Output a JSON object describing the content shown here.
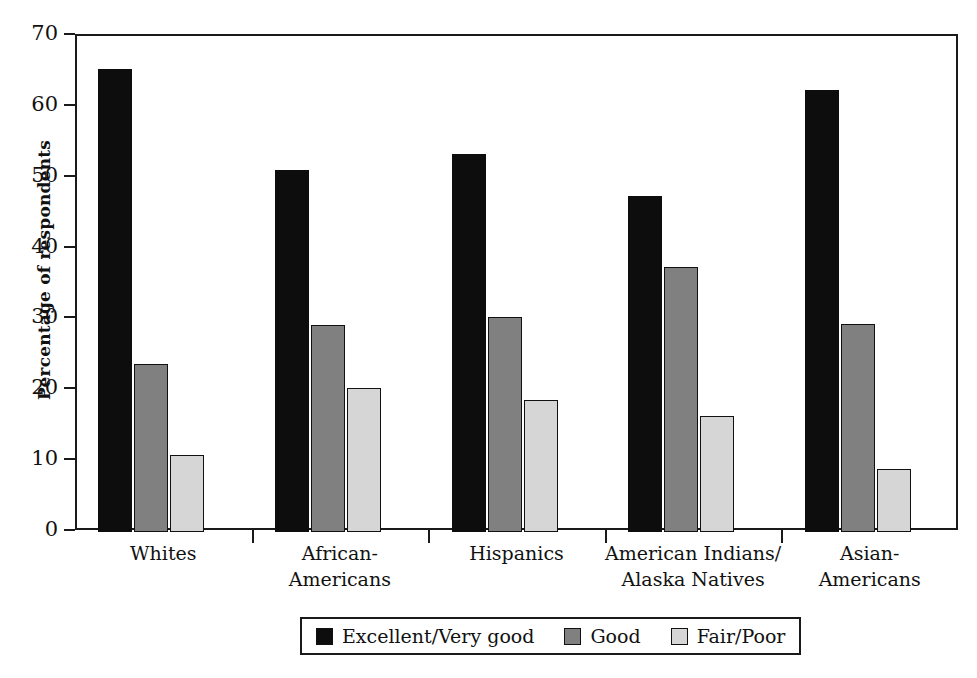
{
  "chart_data": {
    "type": "bar",
    "title": "",
    "subtitle": "",
    "xlabel": "",
    "ylabel": "Percentage of respondents",
    "ylim": [
      0,
      70
    ],
    "yticks": [
      0,
      10,
      20,
      30,
      40,
      50,
      60,
      70
    ],
    "grid": false,
    "legend_position": "bottom",
    "categories": [
      "Whites",
      "African-\nAmericans",
      "Hispanics",
      "American Indians/\nAlaska Natives",
      "Asian-\nAmericans"
    ],
    "category_lines": [
      [
        "Whites"
      ],
      [
        "African-",
        "Americans"
      ],
      [
        "Hispanics"
      ],
      [
        "American Indians/",
        "Alaska Natives"
      ],
      [
        "Asian-",
        "Americans"
      ]
    ],
    "series": [
      {
        "name": "Excellent/Very good",
        "color": "#0d0d0d",
        "values": [
          65.3,
          51.1,
          53.3,
          47.4,
          62.4
        ]
      },
      {
        "name": "Good",
        "color": "#808080",
        "values": [
          23.7,
          29.2,
          30.3,
          37.4,
          29.4
        ]
      },
      {
        "name": "Fair/Poor",
        "color": "#d6d6d6",
        "values": [
          10.9,
          20.3,
          18.6,
          16.4,
          8.9
        ]
      }
    ]
  },
  "legend": {
    "items": [
      {
        "label": "Excellent/Very good",
        "swatch": "black-swatch"
      },
      {
        "label": "Good",
        "swatch": "gray-swatch"
      },
      {
        "label": "Fair/Poor",
        "swatch": "light-gray-swatch"
      }
    ]
  },
  "axis": {
    "y_title": "Percentage of respondents",
    "y_tick_labels": [
      "70",
      "60",
      "50",
      "40",
      "30",
      "20",
      "10",
      "0"
    ]
  }
}
